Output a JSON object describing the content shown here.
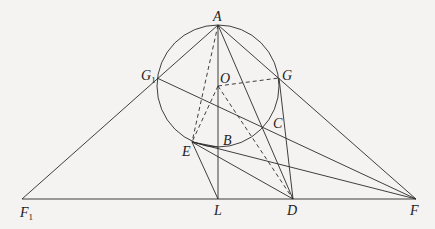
{
  "diagram": {
    "type": "geometry",
    "colors": {
      "background": "#f4f3f1",
      "stroke": "#2a2a2a"
    },
    "circle": {
      "cx": 218,
      "cy": 86,
      "r": 61
    },
    "points": {
      "A": {
        "label": "A",
        "sub": "",
        "x": 218,
        "y": 25
      },
      "O": {
        "label": "O",
        "sub": "",
        "x": 218,
        "y": 86
      },
      "G1": {
        "label": "G",
        "sub": "1",
        "x": 157,
        "y": 78
      },
      "G": {
        "label": "G",
        "sub": "",
        "x": 279,
        "y": 78
      },
      "C": {
        "label": "C",
        "sub": "",
        "x": 263,
        "y": 128
      },
      "B": {
        "label": "B",
        "sub": "",
        "x": 218,
        "y": 146
      },
      "E": {
        "label": "E",
        "sub": "",
        "x": 192,
        "y": 142
      },
      "L": {
        "label": "L",
        "sub": "",
        "x": 218,
        "y": 199
      },
      "D": {
        "label": "D",
        "sub": "",
        "x": 293,
        "y": 199
      },
      "F": {
        "label": "F",
        "sub": "",
        "x": 416,
        "y": 199
      },
      "F1": {
        "label": "F",
        "sub": "1",
        "x": 22,
        "y": 199
      }
    },
    "solid_segments": [
      [
        "F1",
        "F"
      ],
      [
        "F1",
        "A"
      ],
      [
        "A",
        "F"
      ],
      [
        "A",
        "L"
      ],
      [
        "A",
        "D"
      ],
      [
        "G1",
        "F"
      ],
      [
        "E",
        "F"
      ],
      [
        "E",
        "D"
      ],
      [
        "E",
        "L"
      ],
      [
        "G",
        "D"
      ],
      [
        "C",
        "D"
      ]
    ],
    "dashed_segments": [
      [
        "A",
        "E"
      ],
      [
        "O",
        "E"
      ],
      [
        "O",
        "G"
      ],
      [
        "O",
        "D"
      ]
    ]
  }
}
